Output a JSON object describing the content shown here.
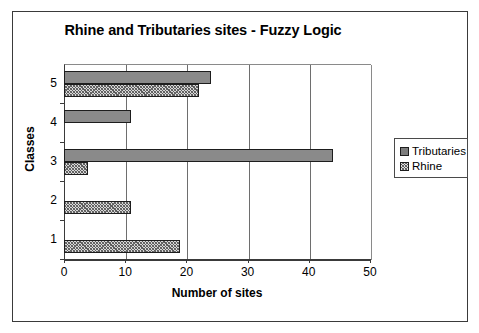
{
  "chart_data": {
    "type": "bar",
    "orientation": "horizontal",
    "title": "Rhine and Tributaries sites - Fuzzy Logic",
    "xlabel": "Number of sites",
    "ylabel": "Classes",
    "categories": [
      "1",
      "2",
      "3",
      "4",
      "5"
    ],
    "xlim": [
      0,
      50
    ],
    "xticks": [
      0,
      10,
      20,
      30,
      40,
      50
    ],
    "xtick_labels": [
      "0",
      "10",
      "20",
      "30",
      "40",
      "50"
    ],
    "grid": "vertical",
    "legend_position": "right",
    "series": [
      {
        "name": "Tributaries",
        "fill": "solid-gray",
        "color": "#7d7d7d",
        "values": [
          0,
          0,
          44,
          11,
          24
        ]
      },
      {
        "name": "Rhine",
        "fill": "hatched",
        "color": "#d8d8d8",
        "values": [
          19,
          11,
          4,
          0,
          22
        ]
      }
    ]
  },
  "legend": {
    "items": [
      {
        "label": "Tributaries"
      },
      {
        "label": "Rhine"
      }
    ]
  }
}
